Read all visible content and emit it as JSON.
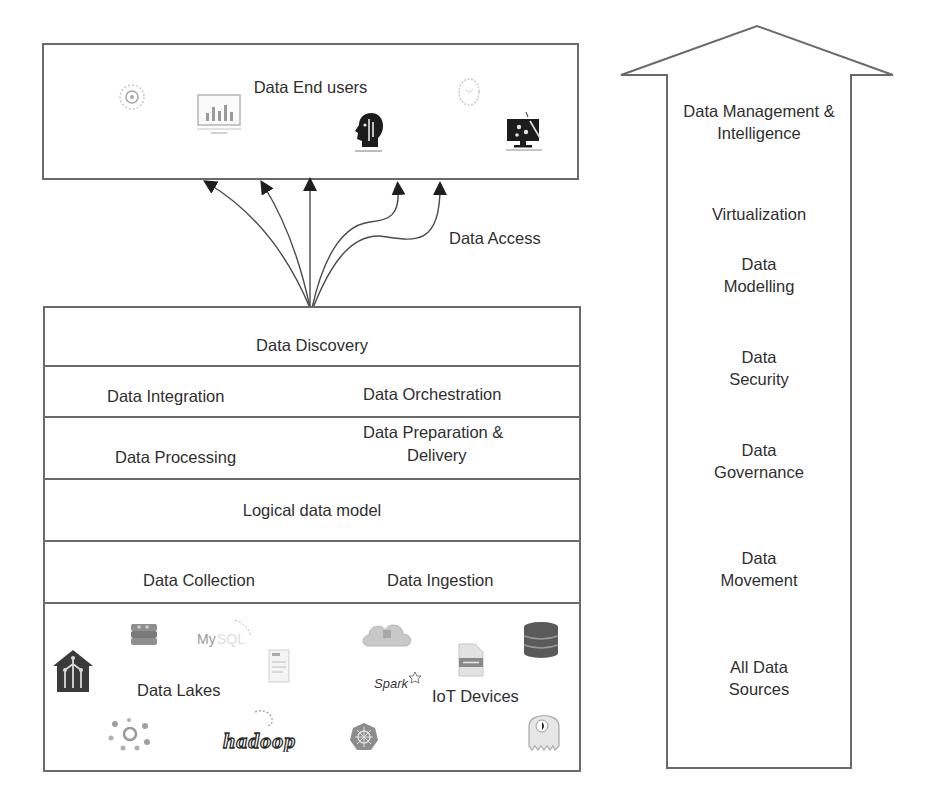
{
  "end_users_box": {
    "title": "Data End users",
    "icons": [
      "gear-circle-icon",
      "monitor-chart-icon",
      "head-profile-icon",
      "globe-circle-icon",
      "monitor-analytics-icon"
    ]
  },
  "data_access": {
    "label": "Data Access",
    "arrow_count": 5
  },
  "stack": {
    "layers": [
      {
        "name": "data-discovery",
        "labels": [
          "Data Discovery"
        ]
      },
      {
        "name": "integration-orchestration",
        "labels": [
          "Data Integration",
          "Data Orchestration"
        ]
      },
      {
        "name": "processing-preparation",
        "labels": [
          "Data Processing",
          "Data Preparation &",
          "Delivery"
        ]
      },
      {
        "name": "logical-data-model",
        "labels": [
          "Logical data model"
        ]
      },
      {
        "name": "collection-ingestion",
        "labels": [
          "Data Collection",
          "Data Ingestion"
        ]
      },
      {
        "name": "sources",
        "labels": [
          "Data Lakes",
          "IoT Devices"
        ]
      }
    ],
    "source_icons": {
      "data_lakes": [
        "data-lake-house-icon",
        "redis-icon",
        "mysql-logo-icon",
        "document-icon",
        "cluster-icon",
        "hadoop-logo-icon"
      ],
      "iot_devices": [
        "cloud-icon",
        "spark-logo-icon",
        "file-icon",
        "database-icon",
        "kubernetes-icon",
        "octopus-icon"
      ],
      "spark_text": "Spark",
      "mysql_text": "MySQL",
      "hadoop_text": "hadoop"
    }
  },
  "side_arrow": {
    "items": [
      {
        "line1": "Data Management &",
        "line2": "Intelligence"
      },
      {
        "line1": "Virtualization",
        "line2": ""
      },
      {
        "line1": "Data",
        "line2": "Modelling"
      },
      {
        "line1": "Data",
        "line2": "Security"
      },
      {
        "line1": "Data",
        "line2": "Governance"
      },
      {
        "line1": "Data",
        "line2": "Movement"
      },
      {
        "line1": "All Data",
        "line2": "Sources"
      }
    ]
  },
  "colors": {
    "stroke": "#6a6a6a",
    "text": "#2f2f2f",
    "icon_dark": "#1f1f1f",
    "icon_light": "#bdbdbd"
  }
}
